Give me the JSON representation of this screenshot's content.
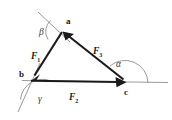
{
  "figure": {
    "background_color": "#ffffff",
    "vector_color": "#1a1a1a",
    "extension_line_color": "#9a9a9a",
    "arc_color": "#8d8d8d",
    "width": 172,
    "height": 120
  },
  "vertices": [
    {
      "id": "a",
      "label": "a",
      "x": 62,
      "y": 30
    },
    {
      "id": "b",
      "label": "b",
      "x": 30,
      "y": 80
    },
    {
      "id": "c",
      "label": "c",
      "x": 125,
      "y": 82
    }
  ],
  "vectors": [
    {
      "id": "F1",
      "label": "F",
      "subscript": "1",
      "from": "a",
      "to": "b",
      "arrow_at": "b"
    },
    {
      "id": "F2",
      "label": "F",
      "subscript": "2",
      "from": "b",
      "to": "c",
      "arrow_at": "c"
    },
    {
      "id": "F3",
      "label": "F",
      "subscript": "3",
      "from": "c",
      "to": "a",
      "arrow_at": "a"
    }
  ],
  "angles": [
    {
      "id": "alpha",
      "label": "α",
      "at_vertex": "c",
      "between": "F3 and horizontal right"
    },
    {
      "id": "beta",
      "label": "β",
      "at_vertex": "a",
      "between": "upper-left extension and F1"
    },
    {
      "id": "gamma",
      "label": "γ",
      "at_vertex": "b",
      "between": "horizontal right and lower-left extension"
    }
  ],
  "extension_lines": [
    {
      "id": "ext-through-a",
      "description": "thin gray line through vertex a extending up-left"
    },
    {
      "id": "ext-through-b",
      "description": "thin gray line through vertex b extending down-left"
    },
    {
      "id": "ext-horizontal",
      "description": "thin gray horizontal baseline through b and c extending right"
    }
  ]
}
